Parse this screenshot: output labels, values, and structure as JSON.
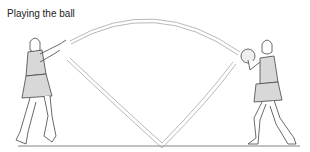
{
  "title": "Playing the ball",
  "figures": [
    {
      "name": "passer",
      "side": "left",
      "action": "throwing"
    },
    {
      "name": "receiver",
      "side": "right",
      "action": "catching ball"
    }
  ],
  "paths": [
    {
      "name": "lob-pass",
      "shape": "arc"
    },
    {
      "name": "bounce-pass",
      "shape": "v"
    }
  ],
  "colors": {
    "line": "#555555",
    "fill": "#d8d8d8",
    "path_fill": "#eeeeee"
  }
}
